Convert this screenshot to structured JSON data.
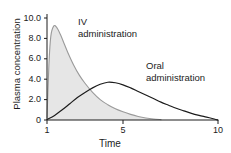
{
  "chart_data": {
    "type": "area",
    "title": "",
    "xlabel": "Time",
    "ylabel": "Plasma concentration",
    "xlim": [
      1,
      10
    ],
    "ylim": [
      0,
      10
    ],
    "grid": false,
    "legend_position": "inline-annotations",
    "xticks": [
      "1",
      "5",
      "10"
    ],
    "xtick_values": [
      1,
      5,
      10
    ],
    "yticks": [
      "0",
      "2.0",
      "4.0",
      "6.0",
      "8.0",
      "10.0"
    ],
    "ytick_values": [
      0,
      2,
      4,
      6,
      8,
      10
    ],
    "series": [
      {
        "name": "IV administration",
        "fill": true,
        "fill_color": "#e6e6e6",
        "line_color": "#9a9a9a",
        "x": [
          1.0,
          1.1,
          1.2,
          1.35,
          1.5,
          1.7,
          1.9,
          2.1,
          2.4,
          2.7,
          3.0,
          3.4,
          3.8,
          4.2,
          4.6,
          5.0,
          5.4,
          5.8,
          6.2,
          6.6,
          7.0
        ],
        "values": [
          0.2,
          5.4,
          8.2,
          9.2,
          9.1,
          8.4,
          7.5,
          6.6,
          5.4,
          4.4,
          3.6,
          2.7,
          2.0,
          1.5,
          1.1,
          0.8,
          0.55,
          0.35,
          0.2,
          0.1,
          0.04
        ]
      },
      {
        "name": "Oral administration",
        "fill": false,
        "fill_color": "none",
        "line_color": "#1c1c1c",
        "x": [
          1.0,
          1.4,
          1.8,
          2.2,
          2.6,
          3.0,
          3.4,
          3.8,
          4.2,
          4.6,
          5.0,
          5.4,
          5.8,
          6.2,
          6.6,
          7.0,
          7.4,
          7.8,
          8.2,
          8.6,
          9.0,
          9.4,
          9.8,
          10.0
        ],
        "values": [
          0.05,
          0.45,
          1.0,
          1.6,
          2.2,
          2.7,
          3.15,
          3.5,
          3.7,
          3.65,
          3.45,
          3.15,
          2.8,
          2.45,
          2.1,
          1.75,
          1.45,
          1.15,
          0.9,
          0.65,
          0.45,
          0.28,
          0.1,
          0.0
        ]
      }
    ],
    "annotations": [
      {
        "name": "iv-administration",
        "line1": "IV",
        "line2": "administration",
        "x_px": 78,
        "y_px": 16
      },
      {
        "name": "oral-administration",
        "line1": "Oral",
        "line2": "administration",
        "x_px": 146,
        "y_px": 60
      }
    ],
    "axis_color": "#1c1c1c",
    "plot_box_px": {
      "left": 47,
      "right": 218,
      "top": 18,
      "bottom": 120
    }
  }
}
